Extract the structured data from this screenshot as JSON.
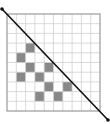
{
  "diagram": {
    "type": "grid-with-diagonal",
    "canvas": {
      "width": 110,
      "height": 124
    },
    "grid": {
      "x": 7,
      "y": 14,
      "width": 93,
      "height": 97,
      "cols": 10,
      "rows": 10,
      "line_color": "#d0d0d0",
      "border_color": "#9a9a9a",
      "background": "#ffffff"
    },
    "shaded_cells": [
      {
        "col": 2,
        "row": 3
      },
      {
        "col": 1,
        "row": 4
      },
      {
        "col": 2,
        "row": 5
      },
      {
        "col": 4,
        "row": 5
      },
      {
        "col": 1,
        "row": 6
      },
      {
        "col": 3,
        "row": 6
      },
      {
        "col": 4,
        "row": 7
      },
      {
        "col": 6,
        "row": 7
      },
      {
        "col": 3,
        "row": 8
      },
      {
        "col": 5,
        "row": 8
      }
    ],
    "shade_color": "#888888",
    "diagonal_line": {
      "x1": 2,
      "y1": 9,
      "x2": 108,
      "y2": 120,
      "color": "#111111",
      "width": 1.6,
      "endpoint_radius": 1.8
    }
  }
}
